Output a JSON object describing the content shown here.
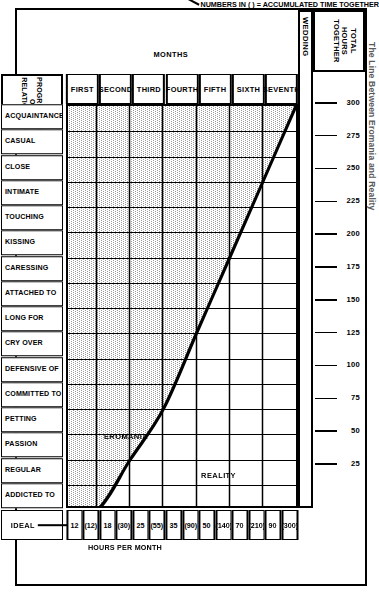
{
  "page": {
    "title": "The Line Between Eromania and Reality"
  },
  "axes": {
    "months_title": "MONTHS",
    "months": [
      "FIRST",
      "SECOND",
      "THIRD",
      "FOURTH",
      "FIFTH",
      "SIXTH",
      "SEVENTH"
    ],
    "wedding_label": "WEDDING",
    "ruler_title": "TOTAL\nHOURS\nTOGETHER",
    "ruler_title_lines": [
      "TOTAL",
      "HOURS",
      "TOGETHER"
    ],
    "ruler_ticks": [
      300,
      275,
      250,
      225,
      200,
      175,
      150,
      125,
      100,
      75,
      50,
      25
    ],
    "ruler_max": 300
  },
  "progression": {
    "header_lines": [
      "PROGRESSION",
      "OF",
      "RELATIONSHIP"
    ],
    "stages": [
      "ADDICTED TO",
      "REGULAR",
      "PASSION",
      "PETTING",
      "COMMITTED TO",
      "DEFENSIVE OF",
      "CRY OVER",
      "LONG FOR",
      "ATTACHED TO",
      "CARESSING",
      "KISSING",
      "TOUCHING",
      "INTIMATE",
      "CLOSE",
      "CASUAL",
      "ACQUAINTANCE"
    ]
  },
  "hours_per_month": {
    "title": "HOURS PER MONTH",
    "accumulated_note": "NUMBERS IN ( ) = ACCUMULATED TIME TOGETHER",
    "values": [
      "12",
      "(12)",
      "18",
      "(30)",
      "25",
      "(55)",
      "35",
      "(90)",
      "50",
      "(140)",
      "70",
      "(210)",
      "90",
      "(300)"
    ],
    "per_month": [
      12,
      18,
      25,
      35,
      50,
      70,
      90
    ],
    "accumulated": [
      12,
      30,
      55,
      90,
      140,
      210,
      300
    ]
  },
  "legend": {
    "ideal_label": "IDEAL",
    "ideal_swatch": "solid-line"
  },
  "annotations": {
    "eromania": "EROMANIA",
    "reality": "REALITY"
  },
  "bands": {
    "relationship_row": [
      {
        "label": "(MARRIAGE)",
        "span_start": 0,
        "span_end": 4
      },
      {
        "label": "DATING RELATIONSHIP",
        "span_start": 4,
        "span_end": 12
      },
      {
        "label": "FRIENDSHIP",
        "span_start": 12,
        "span_end": 16
      }
    ],
    "men_row_label": "MEN",
    "men": [
      {
        "label": "SEXUAL",
        "span_start": 0,
        "span_end": 4
      },
      {
        "label": "EMOTIONAL",
        "span_start": 4,
        "span_end": 8
      },
      {
        "label": "PHYSICAL",
        "span_start": 8,
        "span_end": 12
      },
      {
        "label": "SOCIAL",
        "span_start": 12,
        "span_end": 16
      }
    ],
    "women_row_label": "WOMEN",
    "women": [
      {
        "label": "SEXUAL",
        "span_start": 0,
        "span_end": 4
      },
      {
        "label": "PHYSICAL",
        "span_start": 4,
        "span_end": 8
      },
      {
        "label": "EMOTIONAL",
        "span_start": 8,
        "span_end": 12
      },
      {
        "label": "SOCIAL",
        "span_start": 12,
        "span_end": 16
      }
    ]
  },
  "chart_data": {
    "type": "line",
    "title": "The Line Between Eromania and Reality",
    "xlabel": "MONTHS",
    "ylabel": "PROGRESSION OF RELATIONSHIP",
    "x": [
      "FIRST",
      "SECOND",
      "THIRD",
      "FOURTH",
      "FIFTH",
      "SIXTH",
      "SEVENTH"
    ],
    "y_categories": [
      "ACQUAINTANCE",
      "CASUAL",
      "CLOSE",
      "INTIMATE",
      "TOUCHING",
      "KISSING",
      "CARESSING",
      "ATTACHED TO",
      "LONG FOR",
      "CRY OVER",
      "DEFENSIVE OF",
      "COMMITTED TO",
      "PETTING",
      "PASSION",
      "REGULAR",
      "ADDICTED TO"
    ],
    "secondary_axis": {
      "label": "TOTAL HOURS TOGETHER",
      "ticks": [
        25,
        50,
        75,
        100,
        125,
        150,
        175,
        200,
        225,
        250,
        275,
        300
      ],
      "range": [
        0,
        300
      ]
    },
    "series": [
      {
        "name": "IDEAL",
        "style": "solid-thick",
        "description": "Ideal progression curve separating EROMANIA (above/left, shaded) from REALITY (below/right, unshaded)",
        "points": [
          {
            "month": "FIRST",
            "stage_index": 0,
            "stage": "ACQUAINTANCE",
            "hours_per_month": 12,
            "accumulated": 12
          },
          {
            "month": "SECOND",
            "stage_index": 2,
            "stage": "CLOSE",
            "hours_per_month": 18,
            "accumulated": 30
          },
          {
            "month": "THIRD",
            "stage_index": 4,
            "stage": "TOUCHING",
            "hours_per_month": 25,
            "accumulated": 55
          },
          {
            "month": "FOURTH",
            "stage_index": 7,
            "stage": "ATTACHED TO",
            "hours_per_month": 35,
            "accumulated": 90
          },
          {
            "month": "FIFTH",
            "stage_index": 10,
            "stage": "DEFENSIVE OF",
            "hours_per_month": 50,
            "accumulated": 140
          },
          {
            "month": "SIXTH",
            "stage_index": 13,
            "stage": "PASSION",
            "hours_per_month": 70,
            "accumulated": 210
          },
          {
            "month": "SEVENTH",
            "stage_index": 16,
            "stage": "ADDICTED TO",
            "hours_per_month": 90,
            "accumulated": 300
          }
        ]
      }
    ],
    "regions": [
      {
        "name": "EROMANIA",
        "fill": "dotted-gray",
        "side": "above-left"
      },
      {
        "name": "REALITY",
        "fill": "white",
        "side": "below-right"
      }
    ],
    "grid": true,
    "legend_position": "bottom-right"
  },
  "colors": {
    "ink": "#000000",
    "paper": "#ffffff",
    "shade": "#c9c9c9",
    "title_gray": "#5a5a5a"
  }
}
